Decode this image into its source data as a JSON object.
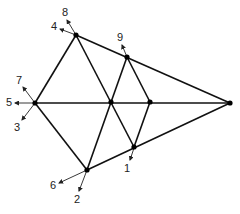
{
  "diagram": {
    "type": "geometric-graph",
    "colors": {
      "line": "#111111",
      "node": "#000000",
      "label": "#222222",
      "background": "#ffffff"
    },
    "nodes": [
      {
        "id": "top",
        "x": 76,
        "y": 35
      },
      {
        "id": "left",
        "x": 35,
        "y": 103
      },
      {
        "id": "center",
        "x": 111,
        "y": 102
      },
      {
        "id": "midright",
        "x": 150,
        "y": 102
      },
      {
        "id": "apex",
        "x": 230,
        "y": 103
      },
      {
        "id": "upper",
        "x": 127,
        "y": 57
      },
      {
        "id": "lower",
        "x": 134,
        "y": 147
      },
      {
        "id": "bottom",
        "x": 87,
        "y": 170
      }
    ],
    "edges": [
      {
        "from": "top",
        "to": "apex",
        "x1": 76,
        "y1": 35,
        "x2": 230,
        "y2": 103
      },
      {
        "from": "bottom",
        "to": "apex",
        "x1": 87,
        "y1": 170,
        "x2": 230,
        "y2": 103
      },
      {
        "from": "left",
        "to": "apex",
        "x1": 35,
        "y1": 103,
        "x2": 230,
        "y2": 103
      },
      {
        "from": "left",
        "to": "top",
        "x1": 35,
        "y1": 103,
        "x2": 76,
        "y2": 35
      },
      {
        "from": "left",
        "to": "bottom",
        "x1": 35,
        "y1": 103,
        "x2": 87,
        "y2": 170
      },
      {
        "from": "top",
        "to": "lower",
        "x1": 76,
        "y1": 35,
        "x2": 134,
        "y2": 147
      },
      {
        "from": "bottom",
        "to": "upper",
        "x1": 87,
        "y1": 170,
        "x2": 127,
        "y2": 57
      },
      {
        "from": "upper",
        "to": "midright",
        "x1": 127,
        "y1": 57,
        "x2": 150,
        "y2": 102
      },
      {
        "from": "midright",
        "to": "lower",
        "x1": 150,
        "y1": 102,
        "x2": 134,
        "y2": 147
      }
    ],
    "labels": [
      {
        "text": "1",
        "x": 127,
        "y": 169,
        "ax1": 134,
        "ay1": 148,
        "ax2": 130,
        "ay2": 160
      },
      {
        "text": "2",
        "x": 77,
        "y": 200,
        "ax1": 87,
        "ay1": 170,
        "ax2": 79,
        "ay2": 191
      },
      {
        "text": "3",
        "x": 17,
        "y": 128,
        "ax1": 35,
        "ay1": 103,
        "ax2": 22,
        "ay2": 120
      },
      {
        "text": "4",
        "x": 54,
        "y": 27,
        "ax1": 76,
        "ay1": 35,
        "ax2": 60,
        "ay2": 29
      },
      {
        "text": "5",
        "x": 9,
        "y": 103,
        "ax1": 35,
        "ay1": 103,
        "ax2": 15,
        "ay2": 103
      },
      {
        "text": "6",
        "x": 53,
        "y": 186,
        "ax1": 87,
        "ay1": 170,
        "ax2": 59,
        "ay2": 183
      },
      {
        "text": "7",
        "x": 19,
        "y": 81,
        "ax1": 35,
        "ay1": 103,
        "ax2": 23,
        "ay2": 87
      },
      {
        "text": "8",
        "x": 65,
        "y": 13,
        "ax1": 76,
        "ay1": 35,
        "ax2": 67,
        "ay2": 20
      },
      {
        "text": "9",
        "x": 120,
        "y": 38,
        "ax1": 127,
        "ay1": 57,
        "ax2": 122,
        "ay2": 45
      }
    ]
  }
}
